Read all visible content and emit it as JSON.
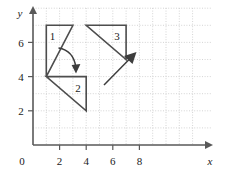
{
  "figure": {
    "title": "",
    "axes": {
      "x_axis_label": "x",
      "y_axis_label": "y",
      "origin_label": "0",
      "x_ticks": [
        "2",
        "4",
        "6",
        "8"
      ],
      "y_ticks": [
        "2",
        "4",
        "6"
      ],
      "x_range": [
        0,
        9.2
      ],
      "y_range": [
        0,
        8.1
      ],
      "grid": true,
      "grid_color": "#c9c9c9",
      "axis_color": "#595959"
    },
    "shapes": [
      {
        "name": "triangle-1",
        "label": "1",
        "label_point": [
          1.45,
          6.45
        ],
        "vertices": [
          [
            1,
            7
          ],
          [
            3,
            7
          ],
          [
            1,
            4
          ]
        ],
        "stroke": "#4d4d4d"
      },
      {
        "name": "triangle-2",
        "label": "2",
        "label_point": [
          3.35,
          3.45
        ],
        "vertices": [
          [
            1,
            4
          ],
          [
            4,
            4
          ],
          [
            4,
            2
          ]
        ],
        "stroke": "#4d4d4d"
      },
      {
        "name": "triangle-3",
        "label": "3",
        "label_point": [
          6.3,
          6.45
        ],
        "vertices": [
          [
            4,
            7
          ],
          [
            7,
            7
          ],
          [
            7,
            5
          ]
        ],
        "stroke": "#4d4d4d"
      }
    ],
    "annotations": [
      {
        "name": "rotation-arrow",
        "kind": "curved-arrow",
        "from": [
          1.9,
          5.65
        ],
        "to": [
          2.85,
          4.55
        ],
        "color": "#3d3d3d"
      },
      {
        "name": "translation-arrow",
        "kind": "straight-arrow",
        "from": [
          4.3,
          4.4
        ],
        "to": [
          5.35,
          5.5
        ],
        "color": "#3d3d3d"
      }
    ],
    "caption": ""
  }
}
